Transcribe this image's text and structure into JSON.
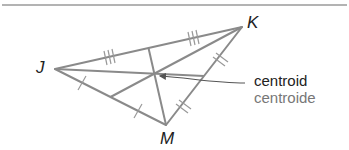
{
  "diagram": {
    "type": "triangle-centroid",
    "vertices": {
      "J": {
        "label": "J",
        "x": 55,
        "y": 69
      },
      "K": {
        "label": "K",
        "x": 242,
        "y": 27
      },
      "M": {
        "label": "M",
        "x": 166,
        "y": 125
      }
    },
    "centroid": {
      "x": 154,
      "y": 74
    },
    "labels": {
      "english": "centroid",
      "spanish": "centroide"
    },
    "tick_marks": {
      "JK": 3,
      "KM": 2,
      "JM": 1
    },
    "colors": {
      "lines": "#8a8a8a",
      "text_primary": "#222222",
      "text_secondary": "#777777",
      "border": "#9a9a9a"
    }
  }
}
